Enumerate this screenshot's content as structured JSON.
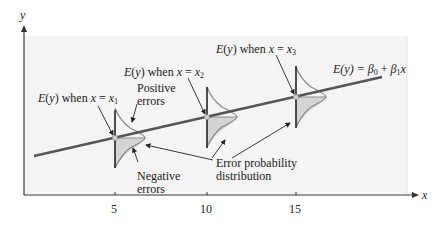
{
  "axes": {
    "y_label": "y",
    "x_label": "x",
    "x_ticks": [
      "5",
      "10",
      "15"
    ]
  },
  "regression_line": {
    "label_lhs": "E(y) = ",
    "beta0": "β",
    "beta0_sub": "0",
    "plus": " + ",
    "beta1": "β",
    "beta1_sub": "1",
    "var": "x"
  },
  "annotations": {
    "x1_label_pre": "E(y) when ",
    "x1_label_var": "x = x",
    "x1_sub": "1",
    "x2_label_pre": "E(y) when ",
    "x2_label_var": "x = x",
    "x2_sub": "2",
    "x3_label_pre": "E(y) when ",
    "x3_label_var": "x = x",
    "x3_sub": "3",
    "positive_errors_line1": "Positive",
    "positive_errors_line2": "errors",
    "negative_errors_line1": "Negative",
    "negative_errors_line2": "errors",
    "error_dist_line1": "Error probability",
    "error_dist_line2": "distribution"
  },
  "colors": {
    "panel": "#f4f4f4",
    "line": "#555555",
    "curve": "#8a8a8a",
    "shade": "#d4d4d4",
    "axis": "#333333"
  }
}
